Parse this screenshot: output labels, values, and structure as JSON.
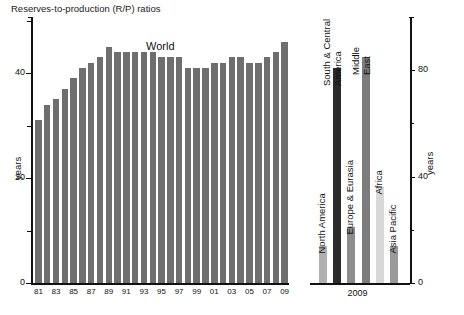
{
  "title": "Reserves-to-production (R/P) ratios",
  "axis": {
    "left_unit": "years",
    "right_unit": "years",
    "left_ticks": [
      "0",
      "20",
      "40"
    ],
    "right_ticks": [
      "0",
      "40",
      "80"
    ]
  },
  "left_panel": {
    "series_label": "World",
    "x_tick_labels": [
      "81",
      "83",
      "85",
      "87",
      "89",
      "91",
      "93",
      "95",
      "97",
      "99",
      "01",
      "03",
      "05",
      "07",
      "09"
    ]
  },
  "right_panel": {
    "group_label": "2009"
  },
  "chart_data": [
    {
      "type": "bar",
      "title": "Reserves-to-production (R/P) ratios",
      "subtitle": "World",
      "xlabel": "",
      "ylabel": "years",
      "ylim": [
        0,
        55
      ],
      "grid": false,
      "legend": "none",
      "axis_side": "left",
      "bar_color": "#6e6e6e",
      "categories": [
        "81",
        "82",
        "83",
        "84",
        "85",
        "86",
        "87",
        "88",
        "89",
        "90",
        "91",
        "92",
        "93",
        "94",
        "95",
        "96",
        "97",
        "98",
        "99",
        "00",
        "01",
        "02",
        "03",
        "04",
        "05",
        "06",
        "07",
        "08",
        "09"
      ],
      "values": [
        31,
        34,
        35,
        37,
        39,
        41,
        42,
        43,
        45,
        44,
        44,
        44,
        44,
        44,
        43,
        43,
        43,
        41,
        41,
        41,
        42,
        42,
        43,
        43,
        42,
        42,
        43,
        44,
        46
      ]
    },
    {
      "type": "bar",
      "title": "",
      "subtitle": "2009",
      "xlabel": "",
      "ylabel": "years",
      "ylim": [
        0,
        100
      ],
      "grid": false,
      "legend": "none",
      "axis_side": "right",
      "categories": [
        "North America",
        "South & Central America",
        "Europe & Eurasia",
        "Middle East",
        "Africa",
        "Asia Pacific"
      ],
      "values": [
        14,
        81,
        21,
        85,
        36,
        14
      ],
      "colors": [
        "#b0b0b0",
        "#2b2b2b",
        "#8d8d8d",
        "#7d7d7d",
        "#d8d8d8",
        "#9a9a9a"
      ]
    }
  ]
}
